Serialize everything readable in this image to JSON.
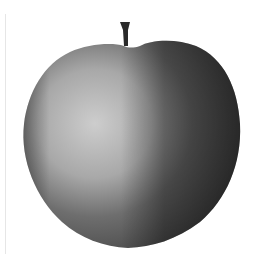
{
  "image": {
    "subject": "apple",
    "description": "Grayscale photograph of an apple with a short stem on a white background",
    "colors": {
      "background": "#ffffff",
      "highlight": "#cfcfcf",
      "midtone": "#8a8a8a",
      "shadow": "#3a3a3a",
      "stem": "#2a2a2a"
    }
  }
}
